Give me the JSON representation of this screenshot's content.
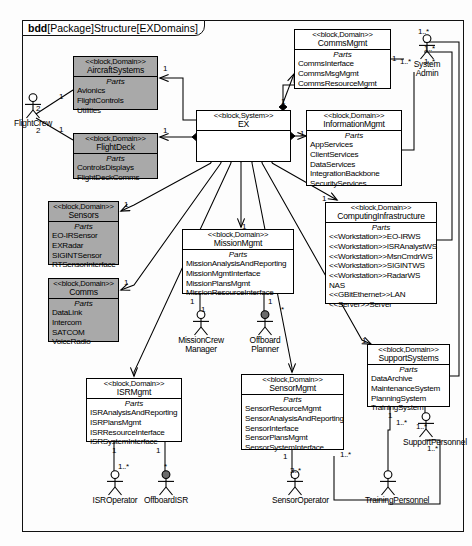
{
  "diagram": {
    "kind": "bdd",
    "title_rest": "[Package]Structure[EXDomains]"
  },
  "blocks": [
    {
      "id": "aircraftsystems",
      "stereotype": "<<block,Domain>>",
      "name": "AircraftSystems",
      "parts_label": "Parts",
      "parts": [
        "Avionics",
        "FlightControls",
        "Utilities"
      ],
      "shaded": true,
      "x": 73,
      "y": 56,
      "w": 85,
      "h": 54
    },
    {
      "id": "flightdeck",
      "stereotype": "<<block,Domain>>",
      "name": "FlightDeck",
      "parts_label": "Parts",
      "parts": [
        "ControlsDisplays",
        "FlightDeckComms"
      ],
      "shaded": true,
      "x": 73,
      "y": 133,
      "w": 85,
      "h": 46
    },
    {
      "id": "sensors",
      "stereotype": "<<block,Domain>>",
      "name": "Sensors",
      "parts_label": "Parts",
      "parts": [
        "EO-IRSensor",
        "EXRadar",
        "SIGINTSensor",
        "RTSensorInterface"
      ],
      "shaded": true,
      "x": 48,
      "y": 201,
      "w": 71,
      "h": 64
    },
    {
      "id": "comms",
      "stereotype": "<<block,Domain>>",
      "name": "Comms",
      "parts_label": "Parts",
      "parts": [
        "DataLink",
        "Intercom",
        "SATCOM",
        "VoiceRadio"
      ],
      "shaded": true,
      "x": 48,
      "y": 278,
      "w": 71,
      "h": 64
    },
    {
      "id": "ex",
      "stereotype": "<<block,System>>",
      "name": "EX",
      "parts_label": "",
      "parts": [],
      "shaded": false,
      "x": 196,
      "y": 110,
      "w": 95,
      "h": 52
    },
    {
      "id": "commsmgmt",
      "stereotype": "<<block,Domain>>",
      "name": "CommsMgmt",
      "parts_label": "Parts",
      "parts": [
        "CommsInterface",
        "CommsMsgMgmt",
        "CommsResourceMgmt"
      ],
      "shaded": false,
      "x": 294,
      "y": 29,
      "w": 97,
      "h": 60
    },
    {
      "id": "informationmgmt",
      "stereotype": "<<block,Domain>>",
      "name": "InformationMgmt",
      "parts_label": "Parts",
      "parts": [
        "AppServices",
        "ClientServices",
        "DataServices",
        "IntegrationBackbone",
        "SecurityServices"
      ],
      "shaded": false,
      "x": 306,
      "y": 110,
      "w": 96,
      "h": 76
    },
    {
      "id": "computinginfrastructure",
      "stereotype": "<<block,Domain>>",
      "name": "ComputingInfrastructure",
      "parts_label": "Parts",
      "parts": [
        "<<Workstation>>EO-IRWS",
        "<<Workstation>>ISRAnalystWS",
        "<<Workstation>>MsnCmdrWS",
        "<<Workstation>>SIGINTWS",
        "<<Workstation>>RadarWS",
        "NAS",
        "<<GBitEthernet>>LAN",
        "<<Server>>Server"
      ],
      "shaded": false,
      "x": 325,
      "y": 202,
      "w": 112,
      "h": 102
    },
    {
      "id": "missionmgmt",
      "stereotype": "<<block,Domain>>",
      "name": "MissionMgmt",
      "parts_label": "Parts",
      "parts": [
        "MissionAnalysisAndReporting",
        "MissionMgmtInterface",
        "MissionPlansMgmt",
        "MissionResourceInterface"
      ],
      "shaded": false,
      "x": 182,
      "y": 229,
      "w": 112,
      "h": 65
    },
    {
      "id": "supportsystems",
      "stereotype": "<<block,Domain>>",
      "name": "SupportSystems",
      "parts_label": "Parts",
      "parts": [
        "DataArchive",
        "MaintenanceSystem",
        "PlanningSystem",
        "TrainingSystem"
      ],
      "shaded": false,
      "x": 367,
      "y": 344,
      "w": 83,
      "h": 63
    },
    {
      "id": "isrmgmt",
      "stereotype": "<<block,Domain>>",
      "name": "ISRMgmt",
      "parts_label": "Parts",
      "parts": [
        "ISRAnalysisAndReporting",
        "ISRPlansMgmt",
        "ISRResourceInterface",
        "ISRSystemInterface"
      ],
      "shaded": false,
      "x": 86,
      "y": 378,
      "w": 96,
      "h": 64
    },
    {
      "id": "sensormgmt",
      "stereotype": "<<block,Domain>>",
      "name": "SensorMgmt",
      "parts_label": "Parts",
      "parts": [
        "SensorResourceMgmt",
        "SensorAnalysisAndReporting",
        "SensorInterface",
        "SensorPlansMgmt",
        "SensorSystemInterface"
      ],
      "shaded": false,
      "x": 241,
      "y": 374,
      "w": 103,
      "h": 76
    }
  ],
  "actors": [
    {
      "id": "flightcrew",
      "label": "FlightCrew",
      "filled": false,
      "x": 10,
      "y": 93
    },
    {
      "id": "systemadmin",
      "label": "System\nAdmin",
      "filled": false,
      "x": 404,
      "y": 34
    },
    {
      "id": "missioncrewmgr",
      "label": "MissionCrew\nManager",
      "filled": false,
      "x": 178,
      "y": 310
    },
    {
      "id": "offboardplanner",
      "label": "Offboard\nPlanner",
      "filled": true,
      "x": 242,
      "y": 310
    },
    {
      "id": "isroperator",
      "label": "ISROperator",
      "filled": false,
      "x": 92,
      "y": 470
    },
    {
      "id": "offboardisr",
      "label": "OffboardISR",
      "filled": true,
      "x": 143,
      "y": 470
    },
    {
      "id": "sensoroperator",
      "label": "SensorOperator",
      "filled": false,
      "x": 272,
      "y": 470
    },
    {
      "id": "trainingpersonnel",
      "label": "TrainingPersonnel",
      "filled": false,
      "x": 365,
      "y": 470
    },
    {
      "id": "supportpersonnel",
      "label": "SupportPersonnel",
      "filled": false,
      "x": 403,
      "y": 412
    }
  ],
  "multiplicities": [
    {
      "id": "m-fc-ac",
      "text": "2",
      "x": 36,
      "y": 104
    },
    {
      "id": "m-ac-fc",
      "text": "1",
      "x": 59,
      "y": 92
    },
    {
      "id": "m-fc-fd",
      "text": "2",
      "x": 36,
      "y": 126
    },
    {
      "id": "m-fd-fc",
      "text": "1",
      "x": 59,
      "y": 125
    },
    {
      "id": "m-ex-ac",
      "text": "1",
      "x": 163,
      "y": 64
    },
    {
      "id": "m-ex-fd",
      "text": "1",
      "x": 163,
      "y": 126
    },
    {
      "id": "m-ex-sen",
      "text": "1",
      "x": 124,
      "y": 200
    },
    {
      "id": "m-ex-com",
      "text": "1",
      "x": 124,
      "y": 278
    },
    {
      "id": "m-ex-cm",
      "text": "1",
      "x": 281,
      "y": 97
    },
    {
      "id": "m-ex-im",
      "text": "1",
      "x": 300,
      "y": 129
    },
    {
      "id": "m-ex-ci",
      "text": "1",
      "x": 322,
      "y": 194
    },
    {
      "id": "m-ex-mm",
      "text": "1",
      "x": 242,
      "y": 222
    },
    {
      "id": "m-ex-ss",
      "text": "1",
      "x": 362,
      "y": 336
    },
    {
      "id": "m-cm-sa",
      "text": "1",
      "x": 392,
      "y": 54
    },
    {
      "id": "m-sa-1",
      "text": "1..*",
      "x": 418,
      "y": 27
    },
    {
      "id": "m-sa-2",
      "text": "1..*",
      "x": 424,
      "y": 44
    },
    {
      "id": "m-sa-3",
      "text": "1..*",
      "x": 400,
      "y": 57
    },
    {
      "id": "m-sa-4",
      "text": "1..*",
      "x": 424,
      "y": 57
    },
    {
      "id": "m-mm-mcm",
      "text": "1",
      "x": 190,
      "y": 297
    },
    {
      "id": "m-mcm",
      "text": "1",
      "x": 201,
      "y": 305
    },
    {
      "id": "m-mm-op",
      "text": "1",
      "x": 268,
      "y": 297
    },
    {
      "id": "m-op",
      "text": "*",
      "x": 281,
      "y": 305
    },
    {
      "id": "m-isr-1",
      "text": "1",
      "x": 112,
      "y": 446
    },
    {
      "id": "m-isrop",
      "text": "1..*",
      "x": 118,
      "y": 462
    },
    {
      "id": "m-isr-2",
      "text": "1",
      "x": 156,
      "y": 446
    },
    {
      "id": "m-offisr",
      "text": "*",
      "x": 164,
      "y": 462
    },
    {
      "id": "m-sm-1",
      "text": "1",
      "x": 283,
      "y": 452
    },
    {
      "id": "m-sensop",
      "text": "3..*",
      "x": 290,
      "y": 466
    },
    {
      "id": "m-ss-tr",
      "text": "1",
      "x": 388,
      "y": 411
    },
    {
      "id": "m-tp-1",
      "text": "1..*",
      "x": 396,
      "y": 418
    },
    {
      "id": "m-tp-2",
      "text": "1..*",
      "x": 340,
      "y": 450
    },
    {
      "id": "m-sp-1",
      "text": "1..*",
      "x": 416,
      "y": 422
    },
    {
      "id": "m-sp-2",
      "text": "1..*",
      "x": 427,
      "y": 444
    }
  ]
}
